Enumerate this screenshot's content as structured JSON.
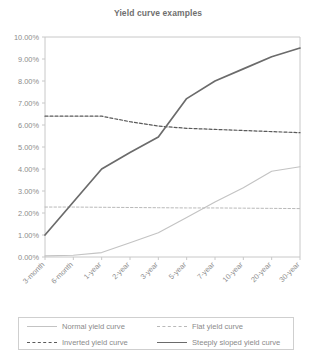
{
  "chart_data": {
    "type": "line",
    "title": "Yield curve examples",
    "xlabel": "",
    "ylabel": "",
    "ylim": [
      0,
      10
    ],
    "ytick_labels": [
      "0.00%",
      "1.00%",
      "2.00%",
      "3.00%",
      "4.00%",
      "5.00%",
      "6.00%",
      "7.00%",
      "8.00%",
      "9.00%",
      "10.00%"
    ],
    "ytick_values": [
      0,
      1,
      2,
      3,
      4,
      5,
      6,
      7,
      8,
      9,
      10
    ],
    "grid": false,
    "legend_position": "bottom",
    "categories": [
      "3-month",
      "6-month",
      "1-year",
      "2-year",
      "3-year",
      "5-year",
      "7-year",
      "10-year",
      "20-year",
      "30-year"
    ],
    "series": [
      {
        "name": "Normal yield curve",
        "values": [
          0.05,
          0.08,
          0.2,
          0.65,
          1.1,
          1.8,
          2.5,
          3.15,
          3.9,
          4.1
        ],
        "color": "#c3c3c3",
        "style": "solid",
        "width": 1.1
      },
      {
        "name": "Inverted yield curve",
        "values": [
          6.4,
          6.4,
          6.4,
          6.15,
          5.95,
          5.85,
          5.8,
          5.75,
          5.7,
          5.65
        ],
        "color": "#5a5a5a",
        "style": "dashed",
        "width": 1.2
      },
      {
        "name": "Flat yield curve",
        "values": [
          2.27,
          2.27,
          2.26,
          2.25,
          2.24,
          2.23,
          2.23,
          2.22,
          2.21,
          2.2
        ],
        "color": "#b9b9b9",
        "style": "dashed",
        "width": 1.0
      },
      {
        "name": "Steeply sloped yield curve",
        "values": [
          1.0,
          2.5,
          4.0,
          4.75,
          5.45,
          7.2,
          8.0,
          8.55,
          9.1,
          9.5
        ],
        "color": "#6b6b6b",
        "style": "solid",
        "width": 1.7
      }
    ]
  },
  "legend": {
    "entries": [
      {
        "label": "Normal yield curve"
      },
      {
        "label": "Flat yield curve"
      },
      {
        "label": "Inverted yield curve"
      },
      {
        "label": "Steeply sloped yield curve"
      }
    ]
  }
}
